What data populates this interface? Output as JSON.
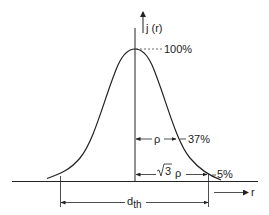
{
  "diagram": {
    "type": "gaussian-profile",
    "y_axis_label": "j (r)",
    "x_axis_label": "r",
    "levels": {
      "peak": "100%",
      "one_over_e": "37%",
      "five_percent": "5%"
    },
    "dimensions": {
      "rho": "ρ",
      "sqrt3_rho_radical": "3",
      "sqrt3_rho_symbol": "ρ",
      "dth_main": "d",
      "dth_sub": "th"
    },
    "colors": {
      "line": "#222222",
      "background": "#ffffff"
    }
  }
}
